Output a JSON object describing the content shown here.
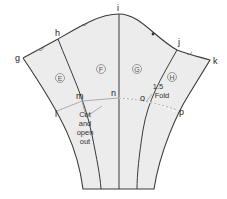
{
  "diagram": {
    "type": "sleeve-pattern-slash-and-spread",
    "points": {
      "g": "g",
      "h": "h",
      "i": "i",
      "j": "j",
      "k": "k",
      "l": "l",
      "m": "m",
      "n": "n",
      "o": "o",
      "p": "p"
    },
    "panels": {
      "E": "E",
      "F": "F",
      "G": "G",
      "H": "H"
    },
    "annotations": {
      "cut_line1": "Cut",
      "cut_line2": "and",
      "cut_line3": "open",
      "cut_line4": "out",
      "fold_line1": "1.5",
      "fold_line2": "Fold"
    },
    "colors": {
      "fill": "#ececec",
      "line": "#3a3a3a"
    }
  }
}
